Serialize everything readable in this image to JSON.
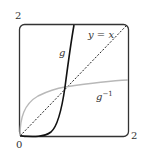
{
  "diagram": {
    "axis_labels": {
      "y_max": "2",
      "x_max": "2",
      "origin": "0"
    },
    "curves": [
      {
        "name": "g",
        "label": "g",
        "style": "solid-dark",
        "color": "#111111"
      },
      {
        "name": "g-inverse",
        "label": "g",
        "superscript": "−1",
        "style": "solid-light",
        "color": "#b5b5b5"
      },
      {
        "name": "identity-line",
        "label": "y = x",
        "style": "dashed",
        "color": "#222222"
      }
    ],
    "frame": {
      "color": "#333333",
      "rounded": true
    }
  }
}
